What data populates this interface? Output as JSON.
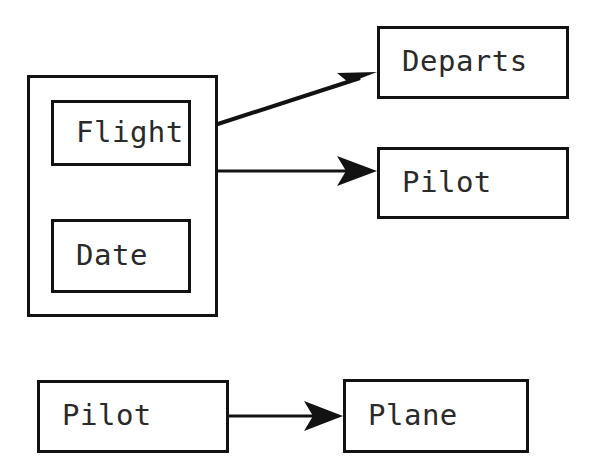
{
  "diagram": {
    "background_color": "#ffffff",
    "stroke_color": "#121212",
    "text_color": "#2a2a2a",
    "nodes": [
      {
        "id": "group",
        "label": "",
        "kind": "group-container"
      },
      {
        "id": "flight",
        "label": "Flight",
        "kind": "entity"
      },
      {
        "id": "date",
        "label": "Date",
        "kind": "entity"
      },
      {
        "id": "departs",
        "label": "Departs",
        "kind": "entity"
      },
      {
        "id": "pilot_top",
        "label": "Pilot",
        "kind": "entity"
      },
      {
        "id": "pilot_bottom",
        "label": "Pilot",
        "kind": "entity"
      },
      {
        "id": "plane",
        "label": "Plane",
        "kind": "entity"
      }
    ],
    "edges": [
      {
        "id": "flight-to-departs",
        "from": "flight",
        "to": "departs",
        "style": "solid-arrow"
      },
      {
        "id": "group-to-pilot",
        "from": "group",
        "to": "pilot_top",
        "style": "solid-arrow"
      },
      {
        "id": "pilot-to-plane",
        "from": "pilot_bottom",
        "to": "plane",
        "style": "solid-arrow"
      }
    ]
  }
}
